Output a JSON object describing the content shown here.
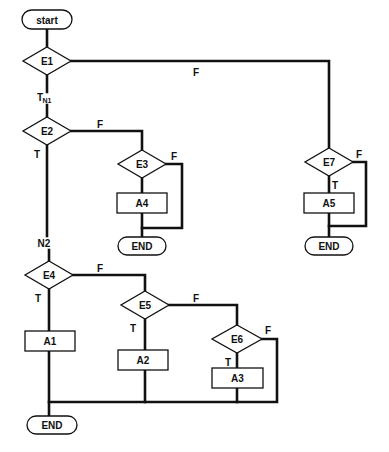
{
  "diagram": {
    "type": "flowchart",
    "terminals": [
      {
        "id": "start",
        "label": "start",
        "x": 22,
        "y": 10,
        "w": 50,
        "h": 19
      },
      {
        "id": "end1",
        "label": "END",
        "x": 118,
        "y": 237,
        "w": 48,
        "h": 18
      },
      {
        "id": "end2",
        "label": "END",
        "x": 305,
        "y": 237,
        "w": 48,
        "h": 18
      },
      {
        "id": "end3",
        "label": "END",
        "x": 27,
        "y": 416,
        "w": 50,
        "h": 18
      }
    ],
    "decisions": [
      {
        "id": "E1",
        "label": "E1",
        "cx": 47,
        "cy": 61,
        "hw": 24,
        "hh": 14
      },
      {
        "id": "E2",
        "label": "E2",
        "cx": 47,
        "cy": 131,
        "hw": 24,
        "hh": 14
      },
      {
        "id": "E3",
        "label": "E3",
        "cx": 142,
        "cy": 164,
        "hw": 24,
        "hh": 14
      },
      {
        "id": "E4",
        "label": "E4",
        "cx": 49,
        "cy": 275,
        "hw": 24,
        "hh": 14
      },
      {
        "id": "E5",
        "label": "E5",
        "cx": 145,
        "cy": 305,
        "hw": 24,
        "hh": 14
      },
      {
        "id": "E6",
        "label": "E6",
        "cx": 237,
        "cy": 339,
        "hw": 25,
        "hh": 14
      },
      {
        "id": "E7",
        "label": "E7",
        "cx": 329,
        "cy": 162,
        "hw": 24,
        "hh": 14
      }
    ],
    "actions": [
      {
        "id": "A1",
        "label": "A1",
        "x": 25,
        "y": 331,
        "w": 50,
        "h": 20
      },
      {
        "id": "A2",
        "label": "A2",
        "x": 118,
        "y": 350,
        "w": 50,
        "h": 20
      },
      {
        "id": "A3",
        "label": "A3",
        "x": 212,
        "y": 368,
        "w": 51,
        "h": 20
      },
      {
        "id": "A4",
        "label": "A4",
        "x": 117,
        "y": 193,
        "w": 50,
        "h": 20
      },
      {
        "id": "A5",
        "label": "A5",
        "x": 304,
        "y": 193,
        "w": 50,
        "h": 20
      }
    ],
    "edge_labels": [
      {
        "text": "F",
        "x": 196,
        "y": 72
      },
      {
        "text": "T",
        "x": 40,
        "y": 97
      },
      {
        "text": "N1",
        "x": 47,
        "y": 100,
        "small": true
      },
      {
        "text": "F",
        "x": 100,
        "y": 124
      },
      {
        "text": "T",
        "x": 37,
        "y": 154
      },
      {
        "text": "F",
        "x": 174,
        "y": 156
      },
      {
        "text": "N2",
        "x": 44,
        "y": 243
      },
      {
        "text": "F",
        "x": 100,
        "y": 268
      },
      {
        "text": "T",
        "x": 38,
        "y": 298
      },
      {
        "text": "F",
        "x": 196,
        "y": 298
      },
      {
        "text": "T",
        "x": 133,
        "y": 328
      },
      {
        "text": "F",
        "x": 268,
        "y": 330
      },
      {
        "text": "T",
        "x": 228,
        "y": 362
      },
      {
        "text": "F",
        "x": 359,
        "y": 154
      },
      {
        "text": "T",
        "x": 335,
        "y": 185
      }
    ],
    "caption": "",
    "edges": [
      "M47 29 L47 47",
      "M71 61 L329 61 L329 148",
      "M47 75 L47 92",
      "M47 105 L47 117",
      "M71 131 L142 131 L142 150",
      "M47 145 L47 236",
      "M49 250 L49 261",
      "M142 178 L142 193",
      "M142 213 L142 237",
      "M166 164 L182 164 L182 228 L142 228",
      "M329 176 L329 193",
      "M329 213 L329 237",
      "M353 162 L366 162 L366 226 L329 226",
      "M73 275 L145 275 L145 291",
      "M49 289 L49 331",
      "M49 351 L49 416",
      "M169 305 L237 305 L237 325",
      "M145 319 L145 350",
      "M145 370 L145 402",
      "M237 353 L237 368",
      "M237 388 L237 402",
      "M262 339 L277 339 L277 402 L49 402"
    ]
  }
}
